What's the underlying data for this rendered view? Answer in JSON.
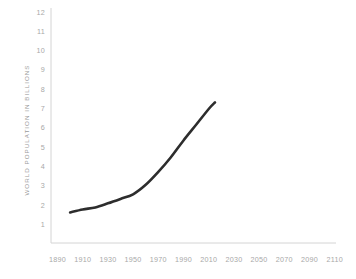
{
  "chart_data": {
    "type": "line",
    "title": "",
    "subtitle": "",
    "xlabel": "",
    "ylabel": "WORLD POPULATION IN BILLIONS",
    "xlim": [
      1890,
      2110
    ],
    "ylim": [
      0,
      12
    ],
    "grid": false,
    "legend": null,
    "x_ticks": [
      "1890",
      "1910",
      "1930",
      "1950",
      "1970",
      "1990",
      "2010",
      "2030",
      "2050",
      "2070",
      "2090",
      "2110"
    ],
    "y_ticks": [
      "1",
      "2",
      "3",
      "4",
      "5",
      "6",
      "7",
      "8",
      "9",
      "10",
      "11",
      "12"
    ],
    "series": [
      {
        "name": "World population",
        "x": [
          1900,
          1910,
          1920,
          1930,
          1940,
          1950,
          1960,
          1970,
          1980,
          1990,
          2000,
          2010,
          2015
        ],
        "values": [
          1.6,
          1.75,
          1.86,
          2.07,
          2.3,
          2.54,
          3.03,
          3.7,
          4.46,
          5.33,
          6.14,
          6.96,
          7.3
        ]
      }
    ],
    "colors": {
      "line": "#2d2d2d",
      "axis": "#d4d4d4",
      "tick_label": "#a8a8a8",
      "axis_title": "#9a9a9a",
      "background": "#ffffff"
    },
    "line_width": 2.6
  }
}
